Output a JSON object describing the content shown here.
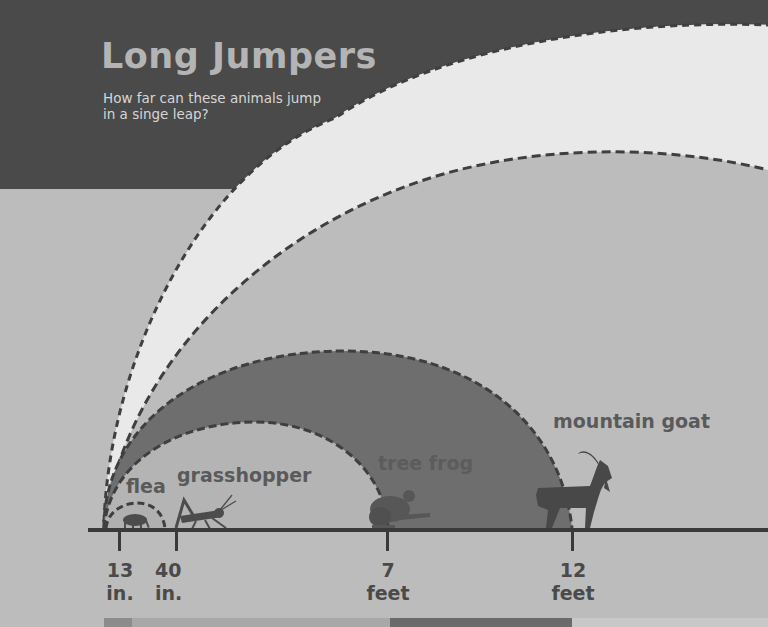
{
  "header": {
    "title": "Long Jumpers",
    "subtitle": "How far can these animals jump in a singe leap?"
  },
  "animals": [
    {
      "name": "flea",
      "label": "flea",
      "distance_value": "13",
      "distance_unit": "in."
    },
    {
      "name": "grasshopper",
      "label": "grasshopper",
      "distance_value": "40",
      "distance_unit": "in."
    },
    {
      "name": "tree-frog",
      "label": "tree frog",
      "distance_value": "7",
      "distance_unit": "feet"
    },
    {
      "name": "mountain-goat",
      "label": "mountain goat",
      "distance_value": "12",
      "distance_unit": "feet"
    }
  ],
  "icons": [
    "flea-icon",
    "grasshopper-icon",
    "tree-frog-icon",
    "mountain-goat-icon"
  ],
  "colors": {
    "header_bg": "#4a4a4a",
    "panel_bg": "#bcbcbc",
    "white_band": "#e9e9e9",
    "tree_frog_fill": "#6e6e6e",
    "grasshopper_fill": "#a9a9a9",
    "flea_fill": "#b0b0b0",
    "dash": "#3f3f3f",
    "baseline": "#3a3a3a",
    "silhouette": "#4c4c4c"
  }
}
